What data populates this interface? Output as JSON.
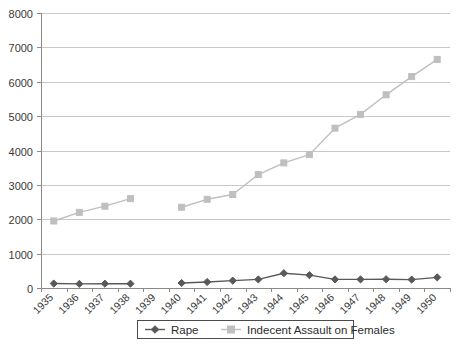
{
  "chart_data": {
    "type": "line",
    "title": "",
    "subtitle": "",
    "xlabel": "",
    "ylabel": "",
    "categories": [
      "1935",
      "1936",
      "1937",
      "1938",
      "1939",
      "1940",
      "1941",
      "1942",
      "1943",
      "1944",
      "1945",
      "1946",
      "1947",
      "1948",
      "1949",
      "1950"
    ],
    "ylim": [
      0,
      8000
    ],
    "ytick_labels": [
      "0",
      "1000",
      "2000",
      "3000",
      "4000",
      "5000",
      "6000",
      "7000",
      "8000"
    ],
    "ytick_values": [
      0,
      1000,
      2000,
      3000,
      4000,
      5000,
      6000,
      7000,
      8000
    ],
    "grid": "horizontal",
    "legend_position": "bottom-center",
    "series": [
      {
        "name": "Rape",
        "color": "#595959",
        "marker": "diamond",
        "values": [
          130,
          120,
          125,
          125,
          null,
          145,
          175,
          215,
          250,
          430,
          375,
          250,
          250,
          255,
          245,
          310
        ]
      },
      {
        "name": "Indecent Assault on Females",
        "color": "#bfbfbf",
        "marker": "square",
        "values": [
          1950,
          2200,
          2380,
          2600,
          null,
          2350,
          2580,
          2720,
          3300,
          3640,
          3880,
          4650,
          5050,
          5620,
          6150,
          6650
        ]
      }
    ]
  },
  "legend": {
    "entries": [
      {
        "label": "Rape"
      },
      {
        "label": "Indecent Assault on Females"
      }
    ]
  },
  "colors": {
    "series_rape": "#595959",
    "series_indecent_assault": "#bfbfbf",
    "gridline": "#c9c9c9",
    "axis": "#8a8a8a",
    "text": "#3a3a3a",
    "background": "#ffffff"
  }
}
